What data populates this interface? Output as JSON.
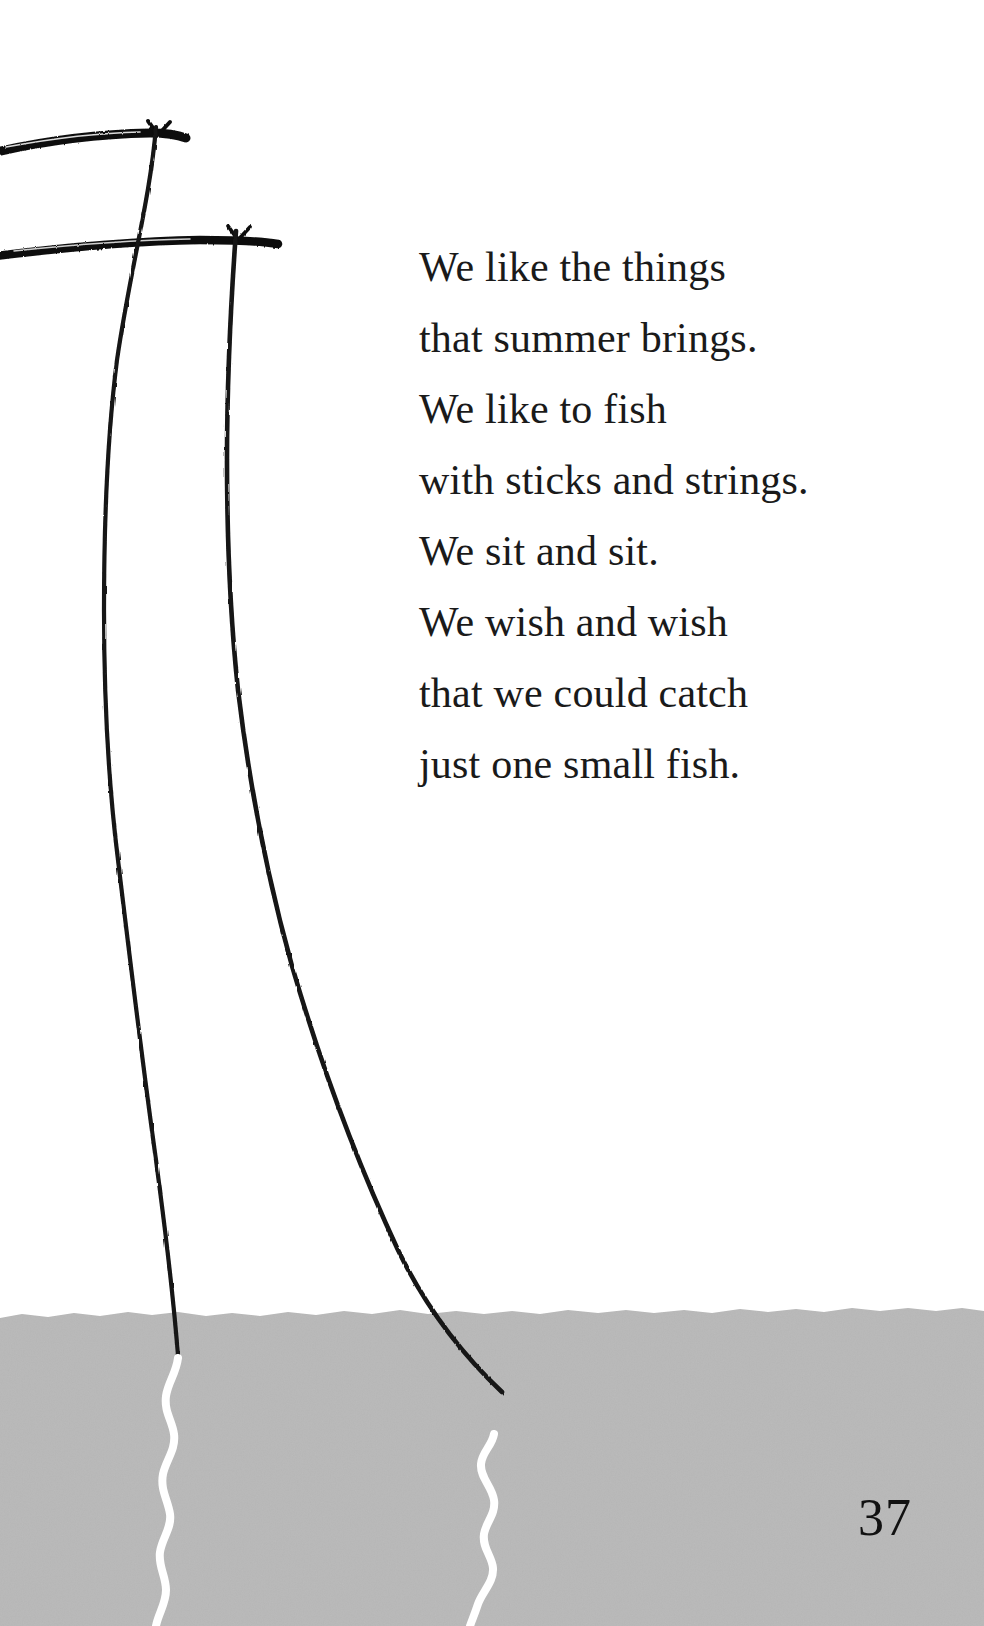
{
  "page": {
    "number": "37",
    "background_color": "#ffffff",
    "width": 984,
    "height": 1626
  },
  "poem": {
    "lines": [
      "We like the things",
      "that summer brings.",
      "We like to fish",
      "with sticks and strings.",
      "We sit and sit.",
      "We wish and wish",
      "that we could catch",
      "just one small fish."
    ],
    "text_color": "#1a1a1a"
  },
  "illustration": {
    "description": "Two fishing rods held from off the left edge, their lines dropping down into gray water at the bottom of the page",
    "ink_color": "#111111",
    "water_color": "#b8b8b8",
    "water_line_color": "#ffffff",
    "water_top_y": 1312,
    "elements": [
      {
        "name": "fishing-rod-upper",
        "y": 138,
        "x_start": 0,
        "x_end": 186,
        "tip_x": 156
      },
      {
        "name": "fishing-rod-lower",
        "y": 243,
        "x_start": 0,
        "x_end": 277,
        "tip_x": 236
      },
      {
        "name": "fishing-line-left",
        "from_x": 156,
        "from_y": 140,
        "enters_water_x": 176,
        "enters_water_y": 1312
      },
      {
        "name": "fishing-line-right",
        "from_x": 236,
        "from_y": 243,
        "enters_water_x": 416,
        "enters_water_y": 1312
      },
      {
        "name": "submerged-line-left",
        "start_x": 178,
        "start_y": 1358,
        "end_x": 172,
        "end_y": 1626
      },
      {
        "name": "submerged-line-right",
        "start_x": 494,
        "start_y": 1434,
        "end_x": 486,
        "end_y": 1626
      }
    ]
  }
}
